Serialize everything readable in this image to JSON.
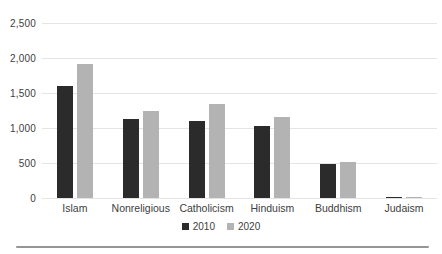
{
  "chart_data": {
    "type": "bar",
    "title": "",
    "xlabel": "",
    "ylabel": "",
    "categories": [
      "Islam",
      "Nonreligious",
      "Catholicism",
      "Hinduism",
      "Buddhism",
      "Judaism"
    ],
    "series": [
      {
        "name": "2010",
        "color": "#2b2b2b",
        "values": [
          1600,
          1130,
          1100,
          1030,
          490,
          15
        ]
      },
      {
        "name": "2020",
        "color": "#b3b3b3",
        "values": [
          1920,
          1240,
          1340,
          1160,
          510,
          15
        ]
      }
    ],
    "ylim": [
      0,
      2500
    ],
    "yticks": [
      {
        "value": 0,
        "label": "0"
      },
      {
        "value": 500,
        "label": "500"
      },
      {
        "value": 1000,
        "label": "1,000"
      },
      {
        "value": 1500,
        "label": "1,500"
      },
      {
        "value": 2000,
        "label": "2,000"
      },
      {
        "value": 2500,
        "label": "2,500"
      }
    ],
    "grid": true,
    "legend_position": "bottom-center"
  },
  "colors": {
    "gridline": "#e4e4e4",
    "axis_text": "#404040",
    "bottom_rule": "#969696",
    "background": "#ffffff"
  },
  "legend": {
    "items": [
      {
        "label": "2010",
        "color": "#2b2b2b"
      },
      {
        "label": "2020",
        "color": "#b3b3b3"
      }
    ]
  }
}
